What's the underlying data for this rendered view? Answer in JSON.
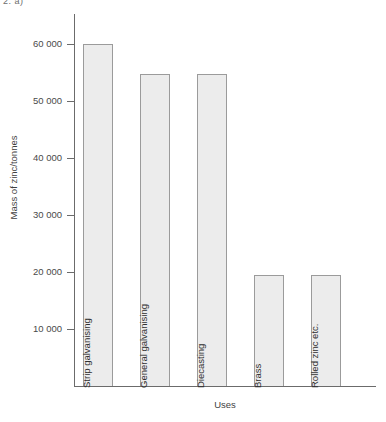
{
  "header": {
    "marker": "2. a)"
  },
  "chart_data": {
    "type": "bar",
    "title": "",
    "xlabel": "Uses",
    "ylabel": "Mass of zinc/tonnes",
    "categories": [
      "Strip galvanising",
      "General  galvanising",
      "Diecasting",
      "Brass",
      "Rolled zinc etc."
    ],
    "values": [
      60000,
      54800,
      54800,
      19500,
      19500
    ],
    "ylim": [
      0,
      65000
    ],
    "yticks": [
      10000,
      20000,
      30000,
      40000,
      50000,
      60000
    ],
    "ytick_labels": [
      "10 000",
      "20 000",
      "30 000",
      "40 000",
      "50 000",
      "60 000"
    ],
    "grid": false,
    "legend": null,
    "bar_fill_color": "#ececec",
    "bar_border_color": "#9b9b9b",
    "axis_color": "#6b6b6b",
    "background_color": "#ffffff"
  }
}
